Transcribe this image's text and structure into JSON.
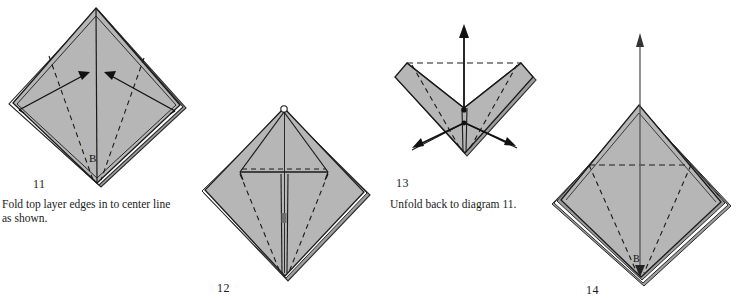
{
  "page": {
    "background_color": "#ffffff",
    "paper_fill_color": "#b6b6b6",
    "paper_fill_shadow_color": "#a3a3a3",
    "line_color": "#1a1a1a",
    "width": 739,
    "height": 303
  },
  "steps": [
    {
      "id": "step-11",
      "number": "11",
      "caption": "Fold top layer edges in to center line\nas shown.",
      "vertex_label": "B",
      "description": "Diamond / kite shape with two inward arrows pointing up toward the center line, dashed valley fold lines from lower vertex fanning out.",
      "arrows": [
        {
          "name": "fold-arrow-left",
          "direction": "up-right"
        },
        {
          "name": "fold-arrow-right",
          "direction": "up-left"
        }
      ],
      "number_pos": {
        "x": 33,
        "y": 183
      },
      "caption_pos": {
        "x": 2,
        "y": 201
      }
    },
    {
      "id": "step-12",
      "number": "12",
      "caption": "",
      "vertex_label": "",
      "description": "Diamond with top layer edges folded to center forming a T-shaped slit and horizontal dashed crease near the middle.",
      "arrows": [],
      "number_pos": {
        "x": 217,
        "y": 283
      },
      "caption_pos": null
    },
    {
      "id": "step-13",
      "number": "13",
      "caption": "Unfold back to diagram 11.",
      "vertex_label": "",
      "description": "Notched shape with a vertical up arrow at the center and two outward arrows pointing down-left and down-right.",
      "arrows": [
        {
          "name": "unfold-arrow-up",
          "direction": "up"
        },
        {
          "name": "unfold-arrow-left",
          "direction": "down-left"
        },
        {
          "name": "unfold-arrow-right",
          "direction": "down-right"
        }
      ],
      "number_pos": {
        "x": 396,
        "y": 181
      },
      "caption_pos": {
        "x": 390,
        "y": 201
      }
    },
    {
      "id": "step-14",
      "number": "14",
      "caption": "",
      "vertex_label": "B",
      "description": "Diamond with horizontal dashed crease and dashed lines to lower vertex, long thin arrow pointing straight up from the apex.",
      "arrows": [
        {
          "name": "lift-arrow-up",
          "direction": "up"
        }
      ],
      "number_pos": {
        "x": 586,
        "y": 285
      },
      "caption_pos": null
    }
  ]
}
